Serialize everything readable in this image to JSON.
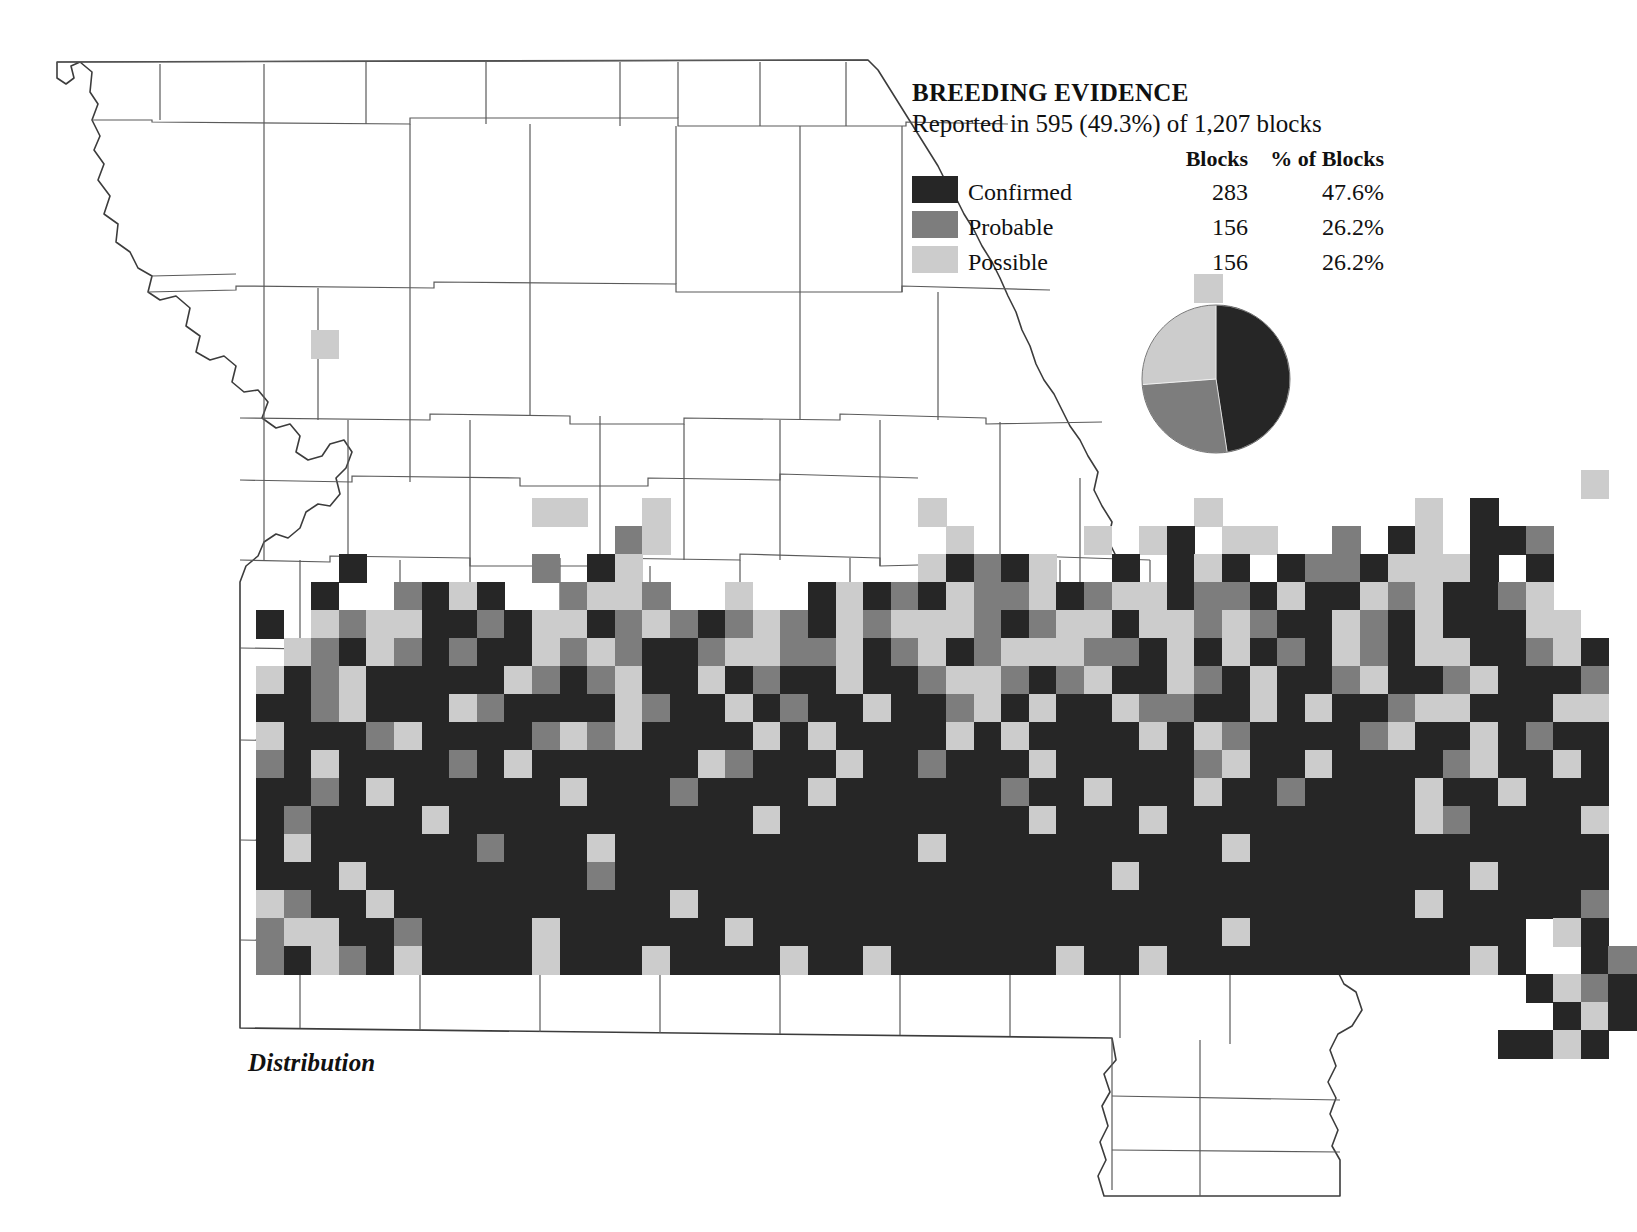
{
  "caption": "Distribution",
  "legend": {
    "title": "BREEDING EVIDENCE",
    "subtitle": "Reported in 595 (49.3%) of 1,207 blocks",
    "col_spacer": "",
    "col_blocks": "Blocks",
    "col_pct": "% of Blocks",
    "rows": [
      {
        "label": "Confirmed",
        "blocks": "283",
        "pct": "47.6%",
        "color": "#262626",
        "swatch_name": "confirmed-swatch"
      },
      {
        "label": "Probable",
        "blocks": "156",
        "pct": "26.2%",
        "color": "#7d7d7d",
        "swatch_name": "probable-swatch"
      },
      {
        "label": "Possible",
        "blocks": "156",
        "pct": "26.2%",
        "color": "#cccccc",
        "swatch_name": "possible-swatch"
      }
    ]
  },
  "colors": {
    "confirmed": "#262626",
    "probable": "#7d7d7d",
    "possible": "#cccccc",
    "county_line": "#5a5a5a",
    "state_line": "#3c3c3c",
    "background": "#ffffff"
  },
  "chart_data": {
    "type": "pie",
    "title": "BREEDING EVIDENCE",
    "subtitle": "Reported in 595 (49.3%) of 1,207 blocks",
    "legend_position": "left",
    "total_blocks": 1207,
    "blocks_with_evidence": 595,
    "percent_with_evidence": 49.3,
    "labels": [
      "Confirmed",
      "Probable",
      "Possible"
    ],
    "values": [
      283,
      156,
      156
    ],
    "percents": [
      47.6,
      26.2,
      26.2
    ],
    "colors": [
      "#262626",
      "#7d7d7d",
      "#cccccc"
    ],
    "start_angle_deg": 0,
    "direction": "clockwise"
  },
  "map": {
    "name": "missouri-breeding-block-map",
    "grid": {
      "x0": 256,
      "y0": 218,
      "cell_w": 27.6,
      "cell_h": 28.0,
      "cols": 42,
      "rows": 30
    },
    "block_codes": {
      "C": "confirmed",
      "P": "probable",
      "O": "possible",
      ".": "none"
    },
    "block_rows": [
      "..................................................",
      "..................................................",
      "..................................O...............",
      "..................................................",
      "..O................................O..............",
      "..................................................",
      "..................................................",
      "..................................................",
      "..................................................",
      "................................................O.",
      "..........OO..O.........O.........O.......O.C.....",
      ".............PO..........O....O.OC.OO..P.CO.CCP...",
      "...C......P.CO..........OCPCO..C.COC.CPPCOOOC.C...",
      "..C..PCOC..POOP..O..COCPCOPPOCPOOCPPCOCCOPOCCPO...",
      "C.OPOOCCPCOOCPOPCPOPCOPOOOPCPOOCOOPOPCCOPCOCCCOO..",
      ".OPCOPCPCCOPOPCCPOOPPOCPOCPOOOPPCOCOCPCOPCOOCCPOC.",
      "OCPOCCCCCOPCPOCCOCPCCOCCPOOPCPOCCOPCOCCPOCCPOCCCP.",
      "CCPOCCCOPCCCCOPCCOCPCCOCCPOCOCCOPPCCOCOCCPOOCCCOO.",
      "OCCCPOCCCCPOPOCCCCOCOCCCCOCOCCCCOCOPCCCCPOCCOCPCC.",
      "PCOCCCCPCOCCCCCCOPCCCOCCPCCCOCCCCCPOCCOCCCCPOCCOC.",
      "CCPCOCCCCCCOCCCPCCCCOCCCCCCPCCOCCCOCCPCCCCOCCOCCC.",
      "CPCCCCOCCCCCCCCCCCOCCCCCCCCCOCCCOCCCCCCCCCOPCCCCO.",
      "COCCCCCCPCCCOCCCCCCCCCCCOCCCCCCCCCCOCCCCCCCCCCCCC.",
      "CCCOCCCCCCCCPCCCCCCCCCCCCCCCCCCOCCCCCCCCCCCCOCCCC.",
      "OPCCOCCCCCCCCCCOCCCCCCCCCCCCCCCCCCCCCCCCCCOCCCCCP",
      "POOCCPCCCCOCCCCCCOCCCCCCCCCCCCCCCCCOCCCCCCCCCC.OC",
      "PCOPCOCCCCOCCCOCCCCOCCOCCCCCCOCCOCCCCCCCCCCCOC..CP",
      "..............................................COPC",
      "...............................................COC",
      ".............................................CCOC."
    ]
  }
}
